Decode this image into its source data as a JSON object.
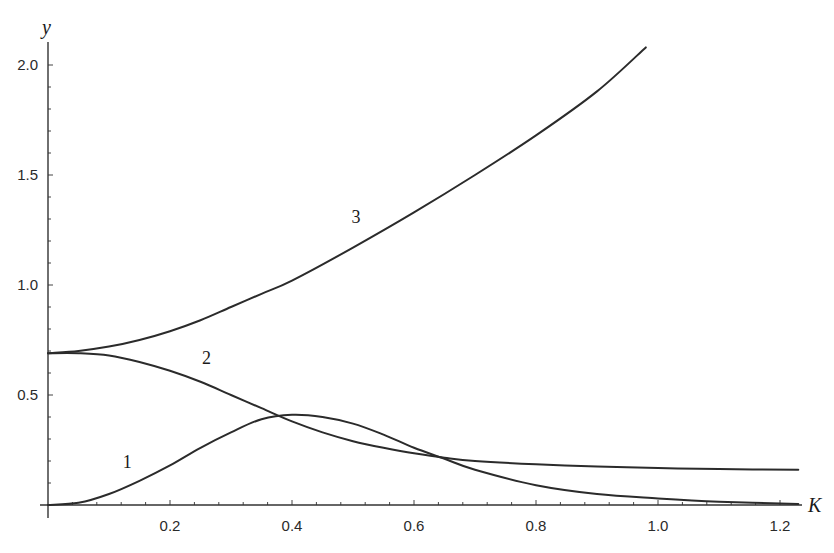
{
  "chart_data": {
    "type": "line",
    "title": "",
    "xlabel": "K",
    "ylabel": "y",
    "xlim": [
      0,
      1.25
    ],
    "ylim": [
      0,
      2.1
    ],
    "grid": false,
    "legend": "inline curve labels 1, 2, 3",
    "x_ticks": [
      "0.2",
      "0.4",
      "0.6",
      "0.8",
      "1.0",
      "1.2"
    ],
    "y_ticks": [
      "0.5",
      "1.0",
      "1.5",
      "2.0"
    ],
    "series": [
      {
        "name": "1",
        "label_position": [
          0.13,
          0.17
        ],
        "points": [
          [
            0,
            0
          ],
          [
            0.05,
            0.01
          ],
          [
            0.1,
            0.05
          ],
          [
            0.15,
            0.11
          ],
          [
            0.2,
            0.18
          ],
          [
            0.25,
            0.26
          ],
          [
            0.3,
            0.33
          ],
          [
            0.35,
            0.39
          ],
          [
            0.4,
            0.41
          ],
          [
            0.45,
            0.4
          ],
          [
            0.5,
            0.37
          ],
          [
            0.55,
            0.32
          ],
          [
            0.6,
            0.26
          ],
          [
            0.65,
            0.21
          ],
          [
            0.7,
            0.16
          ],
          [
            0.8,
            0.09
          ],
          [
            0.9,
            0.05
          ],
          [
            1.0,
            0.03
          ],
          [
            1.1,
            0.015
          ],
          [
            1.23,
            0.005
          ]
        ]
      },
      {
        "name": "2",
        "label_position": [
          0.26,
          0.64
        ],
        "points": [
          [
            0,
            0.69
          ],
          [
            0.05,
            0.69
          ],
          [
            0.1,
            0.68
          ],
          [
            0.15,
            0.65
          ],
          [
            0.2,
            0.61
          ],
          [
            0.25,
            0.56
          ],
          [
            0.3,
            0.5
          ],
          [
            0.35,
            0.44
          ],
          [
            0.4,
            0.38
          ],
          [
            0.45,
            0.33
          ],
          [
            0.5,
            0.29
          ],
          [
            0.55,
            0.26
          ],
          [
            0.6,
            0.235
          ],
          [
            0.65,
            0.215
          ],
          [
            0.7,
            0.2
          ],
          [
            0.8,
            0.185
          ],
          [
            0.9,
            0.175
          ],
          [
            1.0,
            0.168
          ],
          [
            1.1,
            0.163
          ],
          [
            1.23,
            0.16
          ]
        ]
      },
      {
        "name": "3",
        "label_position": [
          0.505,
          1.28
        ],
        "points": [
          [
            0,
            0.69
          ],
          [
            0.05,
            0.7
          ],
          [
            0.1,
            0.72
          ],
          [
            0.15,
            0.75
          ],
          [
            0.2,
            0.79
          ],
          [
            0.25,
            0.84
          ],
          [
            0.3,
            0.9
          ],
          [
            0.35,
            0.96
          ],
          [
            0.4,
            1.02
          ],
          [
            0.5,
            1.17
          ],
          [
            0.6,
            1.33
          ],
          [
            0.7,
            1.5
          ],
          [
            0.8,
            1.68
          ],
          [
            0.9,
            1.88
          ],
          [
            0.98,
            2.08
          ]
        ]
      }
    ],
    "annotations": [
      "Curves 2 and 3 start at y ≈ 0.69 at K = 0",
      "Curves 1 and 2 intersect near (0.38, 0.40) and (0.63, 0.23)"
    ]
  },
  "axes": {
    "x_title": "K",
    "y_title": "y",
    "x_tick_labels": [
      "0.2",
      "0.4",
      "0.6",
      "0.8",
      "1.0",
      "1.2"
    ],
    "y_tick_labels": [
      "0.5",
      "1.0",
      "1.5",
      "2.0"
    ]
  },
  "curve_labels": [
    "1",
    "2",
    "3"
  ]
}
